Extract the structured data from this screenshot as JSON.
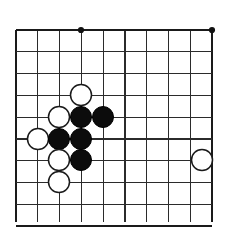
{
  "figure": {
    "kind": "go-board-diagram",
    "background_color": "#ffffff"
  },
  "board": {
    "visible_columns": 10,
    "visible_rows": 10,
    "origin_x": 16,
    "origin_y": 30,
    "spacing": 21.8,
    "line_color": "#2b2b2b",
    "edge_color": "#1a1a1a",
    "edges": {
      "left": 16,
      "top": 30,
      "right": 212,
      "bottom": 222
    },
    "star_points": [
      {
        "name": "star-point-top-left",
        "col": 4,
        "row": 1,
        "x": 81,
        "y": 30
      },
      {
        "name": "star-point-top-right",
        "col": 10,
        "row": 1,
        "x": 212,
        "y": 30
      }
    ]
  },
  "stones": [
    {
      "name": "stone-white-d4",
      "color": "white",
      "color_hex": "#ffffff",
      "col": 4,
      "row": 4,
      "x": 81,
      "y": 95,
      "radius": 10.5
    },
    {
      "name": "stone-white-c5",
      "color": "white",
      "color_hex": "#ffffff",
      "col": 3,
      "row": 5,
      "x": 59,
      "y": 117,
      "radius": 10.5
    },
    {
      "name": "stone-black-d5",
      "color": "black",
      "color_hex": "#0c0c0c",
      "col": 4,
      "row": 5,
      "x": 81,
      "y": 117,
      "radius": 10.5
    },
    {
      "name": "stone-black-e5",
      "color": "black",
      "color_hex": "#0c0c0c",
      "col": 5,
      "row": 5,
      "x": 103,
      "y": 117,
      "radius": 10.5
    },
    {
      "name": "stone-white-b6",
      "color": "white",
      "color_hex": "#ffffff",
      "col": 2,
      "row": 6,
      "x": 38,
      "y": 139,
      "radius": 10.5
    },
    {
      "name": "stone-black-c6",
      "color": "black",
      "color_hex": "#0c0c0c",
      "col": 3,
      "row": 6,
      "x": 59,
      "y": 139,
      "radius": 10.5
    },
    {
      "name": "stone-black-d6",
      "color": "black",
      "color_hex": "#0c0c0c",
      "col": 4,
      "row": 6,
      "x": 81,
      "y": 139,
      "radius": 10.5
    },
    {
      "name": "stone-white-c7",
      "color": "white",
      "color_hex": "#ffffff",
      "col": 3,
      "row": 7,
      "x": 59,
      "y": 160,
      "radius": 10.5
    },
    {
      "name": "stone-black-d7",
      "color": "black",
      "color_hex": "#0c0c0c",
      "col": 4,
      "row": 7,
      "x": 81,
      "y": 160,
      "radius": 10.5
    },
    {
      "name": "stone-white-c8",
      "color": "white",
      "color_hex": "#ffffff",
      "col": 3,
      "row": 8,
      "x": 59,
      "y": 182,
      "radius": 10.5
    },
    {
      "name": "stone-white-i7",
      "color": "white",
      "color_hex": "#ffffff",
      "col": 9,
      "row": 7,
      "x": 202,
      "y": 160,
      "radius": 10.5
    }
  ],
  "counts": {
    "black_stones": 5,
    "white_stones": 6,
    "total_stones": 11
  }
}
